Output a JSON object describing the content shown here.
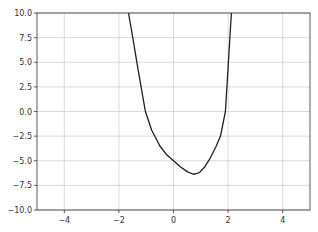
{
  "chart_data": {
    "type": "line",
    "title": "",
    "xlabel": "",
    "ylabel": "",
    "xlim": [
      -5,
      5
    ],
    "ylim": [
      -10,
      10
    ],
    "grid": true,
    "legend": null,
    "x_ticks": [
      -4,
      -2,
      0,
      2,
      4
    ],
    "x_tick_labels": [
      "−4",
      "−2",
      "0",
      "2",
      "4"
    ],
    "y_ticks": [
      10.0,
      7.5,
      5.0,
      2.5,
      0.0,
      -2.5,
      -5.0,
      -7.5,
      -10.0
    ],
    "y_tick_labels": [
      "10.0",
      "7.5",
      "5.0",
      "2.5",
      "0.0",
      "−2.5",
      "−5.0",
      "−7.5",
      "−10.0"
    ],
    "series": [
      {
        "name": "curve",
        "color": "#1f1f1f",
        "x": [
          -1.65,
          -1.5,
          -1.3,
          -1.03,
          -0.8,
          -0.5,
          -0.25,
          0.0,
          0.25,
          0.5,
          0.7,
          0.8,
          0.95,
          1.15,
          1.35,
          1.55,
          1.72,
          1.9,
          2.0,
          2.12
        ],
        "y": [
          10.0,
          7.6,
          4.3,
          0.0,
          -1.9,
          -3.5,
          -4.4,
          -5.0,
          -5.6,
          -6.1,
          -6.35,
          -6.35,
          -6.2,
          -5.6,
          -4.7,
          -3.6,
          -2.5,
          0.0,
          4.5,
          10.0
        ]
      }
    ]
  },
  "colors": {
    "grid": "#d0d0d0",
    "axes": "#333333",
    "line": "#1f1f1f",
    "background": "#ffffff"
  }
}
